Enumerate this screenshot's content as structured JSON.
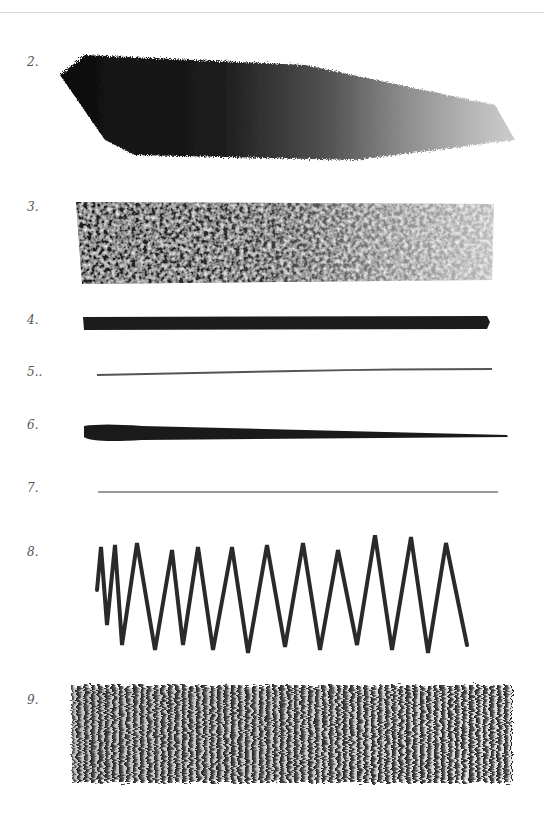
{
  "page": {
    "type": "scanned book page",
    "background": "#ffffff",
    "ink_color": "#1a1a1a"
  },
  "samples": [
    {
      "number": "2.",
      "description": "broad diagonal charcoal hatching, dark to light gradient"
    },
    {
      "number": "3.",
      "description": "wide textured rectangular block, dark left fading to light right"
    },
    {
      "number": "4.",
      "description": "thick even horizontal line"
    },
    {
      "number": "5..",
      "description": "thin light wavy horizontal line"
    },
    {
      "number": "6.",
      "description": "tapering horizontal line, thick left to thin right"
    },
    {
      "number": "7.",
      "description": "very fine horizontal line"
    },
    {
      "number": "8.",
      "description": "zigzag stroke"
    },
    {
      "number": "9.",
      "description": "dense vertical scribble strokes, dark left fading right"
    }
  ]
}
